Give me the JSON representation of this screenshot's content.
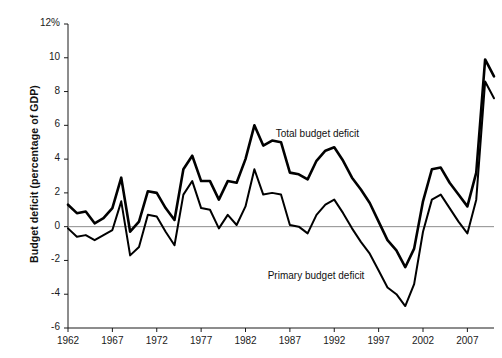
{
  "chart_data": {
    "type": "line",
    "title": "",
    "xlabel": "",
    "ylabel": "Budget deficit (percentage of GDP)",
    "xlim": [
      1962,
      2010
    ],
    "ylim": [
      -6,
      12
    ],
    "grid": false,
    "legend": "inline-annotations",
    "zero_line": 0,
    "y_ticks": [
      12,
      10,
      8,
      6,
      4,
      2,
      0,
      -2,
      -4,
      -6
    ],
    "y_tick_labels": [
      "12%",
      "10",
      "8",
      "6",
      "4",
      "2",
      "0",
      "-2",
      "-4",
      "-6"
    ],
    "x_ticks": [
      1962,
      1967,
      1972,
      1977,
      1982,
      1987,
      1992,
      1997,
      2002,
      2007
    ],
    "x_tick_labels": [
      "1962",
      "1967",
      "1972",
      "1977",
      "1982",
      "1987",
      "1992",
      "1997",
      "2002",
      "2007"
    ],
    "x": [
      1962,
      1963,
      1964,
      1965,
      1966,
      1967,
      1968,
      1969,
      1970,
      1971,
      1972,
      1973,
      1974,
      1975,
      1976,
      1977,
      1978,
      1979,
      1980,
      1981,
      1982,
      1983,
      1984,
      1985,
      1986,
      1987,
      1988,
      1989,
      1990,
      1991,
      1992,
      1993,
      1994,
      1995,
      1996,
      1997,
      1998,
      1999,
      2000,
      2001,
      2002,
      2003,
      2004,
      2005,
      2006,
      2007,
      2008,
      2009,
      2010
    ],
    "series": [
      {
        "name": "Total budget deficit",
        "color": "#000000",
        "label_x": 1985.4,
        "label_y": 5.4,
        "values": [
          1.3,
          0.8,
          0.9,
          0.2,
          0.5,
          1.1,
          2.9,
          -0.3,
          0.3,
          2.1,
          2.0,
          1.1,
          0.4,
          3.4,
          4.2,
          2.7,
          2.7,
          1.6,
          2.7,
          2.6,
          4.0,
          6.0,
          4.8,
          5.1,
          5.0,
          3.2,
          3.1,
          2.8,
          3.9,
          4.5,
          4.7,
          3.9,
          2.9,
          2.2,
          1.4,
          0.3,
          -0.8,
          -1.4,
          -2.4,
          -1.3,
          1.5,
          3.4,
          3.5,
          2.6,
          1.9,
          1.2,
          3.2,
          9.9,
          8.9
        ]
      },
      {
        "name": "Primary budget deficit",
        "color": "#000000",
        "label_x": 1984.5,
        "label_y": -3.0,
        "values": [
          -0.1,
          -0.6,
          -0.5,
          -0.8,
          -0.5,
          -0.2,
          1.5,
          -1.7,
          -1.2,
          0.7,
          0.6,
          -0.3,
          -1.1,
          1.9,
          2.7,
          1.1,
          1.0,
          -0.1,
          0.7,
          0.1,
          1.2,
          3.4,
          1.9,
          2.0,
          1.9,
          0.1,
          0.0,
          -0.4,
          0.7,
          1.3,
          1.6,
          0.8,
          -0.1,
          -0.9,
          -1.6,
          -2.6,
          -3.6,
          -4.0,
          -4.7,
          -3.4,
          -0.3,
          1.6,
          1.9,
          1.1,
          0.3,
          -0.4,
          1.6,
          8.6,
          7.6
        ]
      }
    ]
  }
}
